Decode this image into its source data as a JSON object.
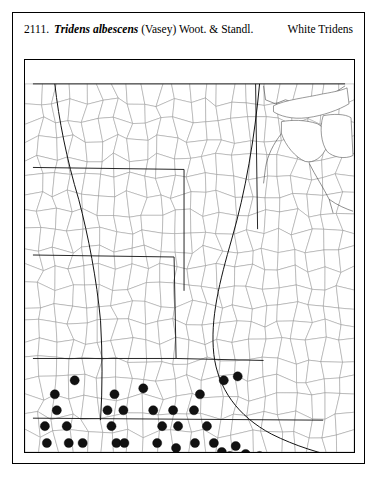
{
  "plate": {
    "number": "2111.",
    "species_name": "Tridens albescens",
    "authority": "(Vasey) Woot. & Standl.",
    "common_name": "White Tridens"
  },
  "map": {
    "type": "distribution-map",
    "region": "north-central United States",
    "frame": {
      "x": 11,
      "y": 46,
      "width": 331,
      "height": 394
    },
    "viewbox": {
      "width": 331,
      "height": 394
    },
    "symbol": {
      "shape": "filled-circle",
      "radius": 4.6,
      "color": "#111111",
      "meaning": "county occurrence record"
    },
    "lakes": [
      "Lake Superior",
      "Lake Michigan",
      "Lake Huron",
      "Lake Erie"
    ],
    "occurrence_points": [
      [
        50,
        322
      ],
      [
        30,
        336
      ],
      [
        32,
        352
      ],
      [
        20,
        368
      ],
      [
        22,
        385
      ],
      [
        42,
        368
      ],
      [
        44,
        385
      ],
      [
        58,
        385
      ],
      [
        28,
        401
      ],
      [
        48,
        401
      ],
      [
        63,
        401
      ],
      [
        90,
        336
      ],
      [
        83,
        352
      ],
      [
        99,
        352
      ],
      [
        87,
        368
      ],
      [
        92,
        385
      ],
      [
        74,
        401
      ],
      [
        96,
        401
      ],
      [
        116,
        401
      ],
      [
        100,
        385
      ],
      [
        119,
        330
      ],
      [
        129,
        352
      ],
      [
        149,
        352
      ],
      [
        138,
        368
      ],
      [
        154,
        368
      ],
      [
        133,
        385
      ],
      [
        152,
        390
      ],
      [
        131,
        401
      ],
      [
        150,
        401
      ],
      [
        170,
        352
      ],
      [
        176,
        336
      ],
      [
        183,
        368
      ],
      [
        171,
        385
      ],
      [
        190,
        385
      ],
      [
        186,
        401
      ],
      [
        198,
        394
      ],
      [
        206,
        398
      ],
      [
        212,
        388
      ],
      [
        222,
        396
      ],
      [
        236,
        398
      ],
      [
        208,
        409
      ],
      [
        196,
        409
      ],
      [
        166,
        409
      ],
      [
        146,
        409
      ],
      [
        120,
        409
      ],
      [
        104,
        409
      ],
      [
        88,
        409
      ],
      [
        72,
        409
      ],
      [
        214,
        318
      ],
      [
        200,
        322
      ]
    ],
    "state_boundaries": [
      "M 8 24 L 322 24",
      "M 8 108 L 160 110",
      "M 160 110 L 160 232",
      "M 232 24 L 234 170",
      "M 8 196 L 150 198",
      "M 150 198 L 152 300",
      "M 8 300 L 152 300",
      "M 152 300 L 240 302",
      "M 8 360 L 300 362"
    ],
    "river_boundary": "M 236 24 C 230 90 214 150 196 206 C 180 258 176 300 196 340 C 214 372 250 392 300 400"
  }
}
